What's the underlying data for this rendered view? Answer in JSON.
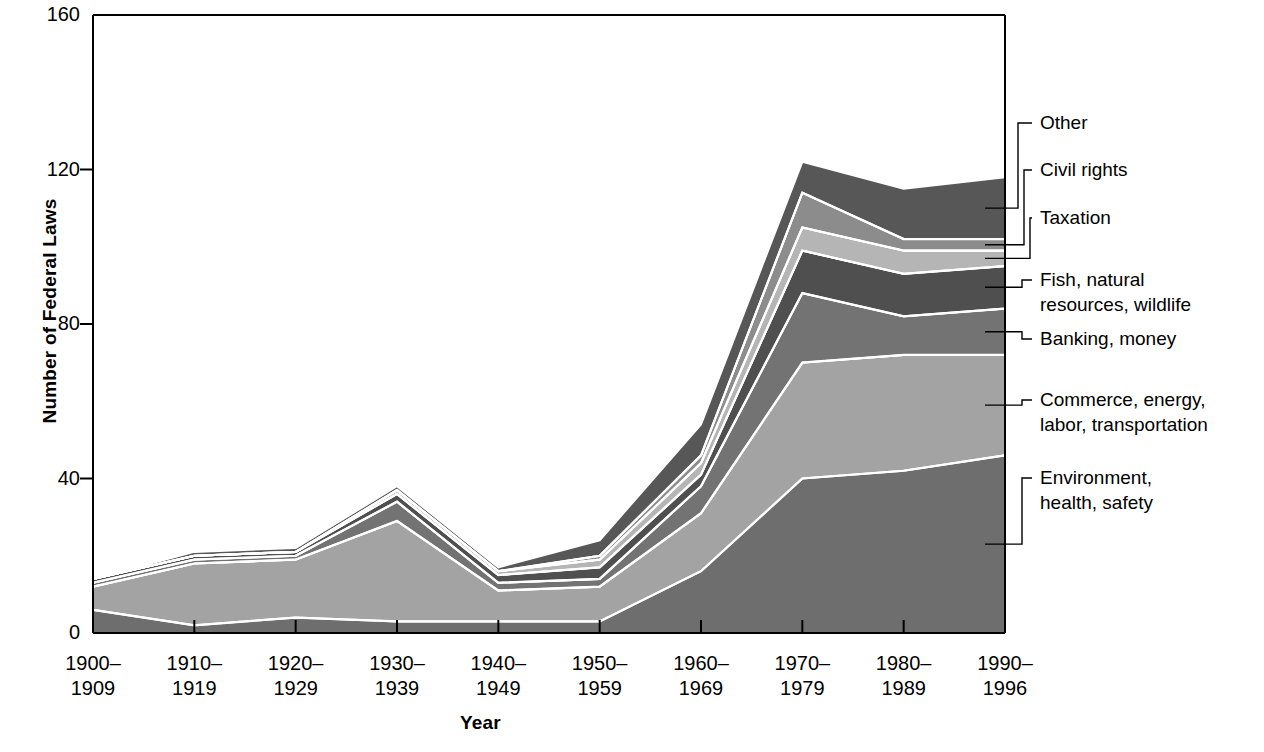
{
  "chart_data": {
    "type": "area",
    "stacked": true,
    "title": "",
    "xlabel": "Year",
    "ylabel": "Number of Federal Laws",
    "categories": [
      "1900–1909",
      "1910–1919",
      "1920–1929",
      "1930–1939",
      "1940–1949",
      "1950–1959",
      "1960–1969",
      "1970–1979",
      "1980–1989",
      "1990–1996"
    ],
    "xtick_lines": [
      [
        "1900–",
        "1909"
      ],
      [
        "1910–",
        "1919"
      ],
      [
        "1920–",
        "1929"
      ],
      [
        "1930–",
        "1939"
      ],
      [
        "1940–",
        "1949"
      ],
      [
        "1950–",
        "1959"
      ],
      [
        "1960–",
        "1969"
      ],
      [
        "1970–",
        "1979"
      ],
      [
        "1980–",
        "1989"
      ],
      [
        "1990–",
        "1996"
      ]
    ],
    "ylim": [
      0,
      160
    ],
    "yticks": [
      0,
      40,
      80,
      120,
      160
    ],
    "ytick_labels": [
      "0",
      "40",
      "80",
      "120",
      "160"
    ],
    "grid": false,
    "legend_position": "right-callout",
    "series": [
      {
        "name": "Environment, health, safety",
        "label_lines": [
          "Environment,",
          "health, safety"
        ],
        "color": "#6e6e6e",
        "values": [
          6,
          2,
          4,
          3,
          3,
          3,
          16,
          40,
          42,
          46
        ]
      },
      {
        "name": "Commerce, energy, labor, transportation",
        "label_lines": [
          "Commerce, energy,",
          "labor, transportation"
        ],
        "color": "#a3a3a3",
        "values": [
          6,
          16,
          15,
          26,
          8,
          9,
          15,
          30,
          30,
          26
        ]
      },
      {
        "name": "Banking, money",
        "label_lines": [
          "Banking, money"
        ],
        "color": "#737373",
        "values": [
          1,
          1,
          1,
          5,
          2,
          2,
          7,
          18,
          10,
          12
        ]
      },
      {
        "name": "Fish, natural resources, wildlife",
        "label_lines": [
          "Fish, natural",
          "resources, wildlife"
        ],
        "color": "#4f4f4f",
        "values": [
          1,
          1,
          1,
          2,
          2,
          3,
          3,
          11,
          11,
          11
        ]
      },
      {
        "name": "Taxation",
        "label_lines": [
          "Taxation"
        ],
        "color": "#b5b5b5",
        "values": [
          0,
          0,
          0,
          1,
          1,
          2,
          3,
          6,
          6,
          4
        ]
      },
      {
        "name": "Civil rights",
        "label_lines": [
          "Civil rights"
        ],
        "color": "#8c8c8c",
        "values": [
          0,
          0,
          0,
          0,
          0,
          1,
          2,
          9,
          3,
          3
        ]
      },
      {
        "name": "Other",
        "label_lines": [
          "Other"
        ],
        "color": "#575757",
        "values": [
          0,
          1,
          1,
          1,
          1,
          4,
          8,
          8,
          13,
          16
        ]
      }
    ],
    "stack_totals": [
      14,
      21,
      22,
      38,
      17,
      24,
      54,
      122,
      115,
      118
    ]
  },
  "axes": {
    "ylabel": "Number of Federal Laws",
    "xlabel": "Year"
  }
}
